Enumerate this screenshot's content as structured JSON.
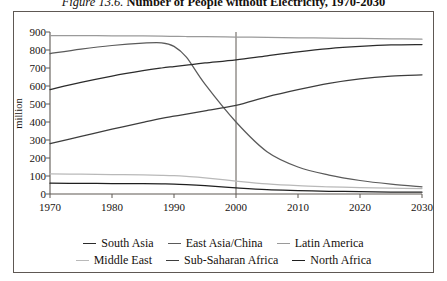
{
  "title": {
    "figure_number": "Figure 13.6.",
    "figure_name": "Number of People without Electricity, 1970-2030"
  },
  "axes": {
    "ylabel": "million",
    "yticks": [
      "900",
      "800",
      "700",
      "600",
      "500",
      "400",
      "300",
      "200",
      "100",
      "0"
    ],
    "xticks": [
      "1970",
      "1980",
      "1990",
      "2000",
      "2010",
      "2020",
      "2030"
    ]
  },
  "legend": {
    "row1": [
      {
        "label": "South Asia",
        "color": "#2b2b2b"
      },
      {
        "label": "East Asia/China",
        "color": "#5a5a5a"
      },
      {
        "label": "Latin America",
        "color": "#9a9a9a"
      }
    ],
    "row2": [
      {
        "label": "Middle East",
        "color": "#b9b9b9"
      },
      {
        "label": "Sub-Saharan Africa",
        "color": "#3d3d3d"
      },
      {
        "label": "North Africa",
        "color": "#1f1f1f"
      }
    ]
  },
  "chart_data": {
    "type": "line",
    "title": "Figure 13.6. Number of People without Electricity, 1970-2030",
    "xlabel": "",
    "ylabel": "million",
    "xlim": [
      1970,
      2030
    ],
    "ylim": [
      0,
      900
    ],
    "yticks": [
      0,
      100,
      200,
      300,
      400,
      500,
      600,
      700,
      800,
      900
    ],
    "xticks": [
      1970,
      1980,
      1990,
      2000,
      2010,
      2020,
      2030
    ],
    "grid": false,
    "legend_position": "bottom",
    "reference_line": {
      "x": 2000,
      "label": "",
      "color": "#5e5853"
    },
    "x": [
      1970,
      1975,
      1980,
      1985,
      1988,
      1990,
      1992,
      1995,
      2000,
      2005,
      2010,
      2015,
      2020,
      2025,
      2030
    ],
    "series": [
      {
        "name": "East Asia/China",
        "color": "#5a5a5a",
        "values": [
          780,
          805,
          825,
          838,
          840,
          820,
          760,
          610,
          400,
          235,
          150,
          105,
          75,
          55,
          40
        ]
      },
      {
        "name": "South Asia",
        "color": "#2b2b2b",
        "values": [
          580,
          620,
          655,
          685,
          700,
          708,
          716,
          728,
          745,
          768,
          790,
          808,
          820,
          828,
          830
        ]
      },
      {
        "name": "Sub-Saharan Africa",
        "color": "#3d3d3d",
        "values": [
          280,
          320,
          360,
          398,
          420,
          432,
          444,
          462,
          492,
          540,
          580,
          615,
          640,
          655,
          662
        ]
      },
      {
        "name": "Latin America",
        "color": "#9a9a9a",
        "values": [
          880,
          880,
          879,
          878,
          877,
          876,
          875,
          874,
          872,
          870,
          868,
          866,
          864,
          862,
          860
        ]
      },
      {
        "name": "Middle East",
        "color": "#b9b9b9",
        "values": [
          112,
          110,
          108,
          106,
          104,
          102,
          98,
          90,
          72,
          56,
          46,
          40,
          35,
          32,
          30
        ]
      },
      {
        "name": "North Africa",
        "color": "#1f1f1f",
        "values": [
          60,
          59,
          58,
          57,
          56,
          55,
          52,
          46,
          34,
          24,
          19,
          15,
          13,
          11,
          10
        ]
      }
    ]
  }
}
